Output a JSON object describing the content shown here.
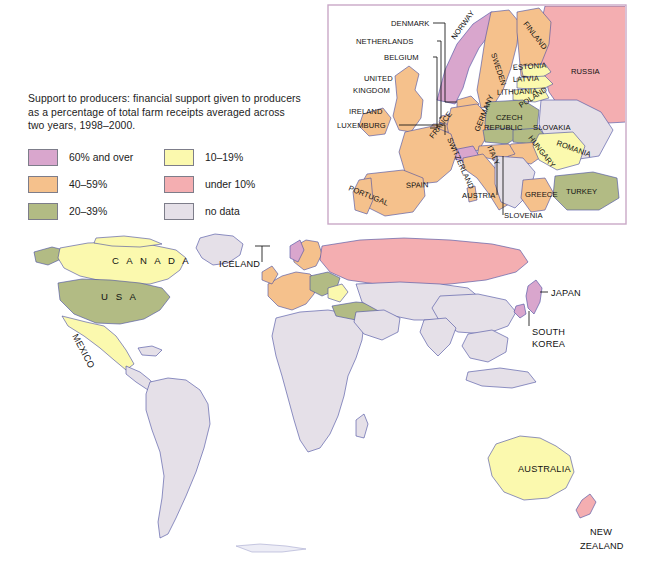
{
  "legend": {
    "caption": "Support to producers: financial support given to producers as a percentage of total farm receipts averaged across two years, 1998–2000.",
    "items": [
      {
        "label": "60% and over",
        "color": "#d9a6cd",
        "name": "legend-swatch-60-and-over"
      },
      {
        "label": "10–19%",
        "color": "#fbf9ae",
        "name": "legend-swatch-10-19"
      },
      {
        "label": "40–59%",
        "color": "#f5c18c",
        "name": "legend-swatch-40-59"
      },
      {
        "label": "under 10%",
        "color": "#f4aeb1",
        "name": "legend-swatch-under-10"
      },
      {
        "label": "20–39%",
        "color": "#b2bb84",
        "name": "legend-swatch-20-39"
      },
      {
        "label": "no data",
        "color": "#e5e0e8",
        "name": "legend-swatch-no-data"
      }
    ]
  },
  "palette": {
    "over60": "#d9a6cd",
    "p40_59": "#f5c18c",
    "p20_39": "#b2bb84",
    "p10_19": "#fbf9ae",
    "under10": "#f4aeb1",
    "nodata": "#e5e0e8",
    "ocean": "#ffffff",
    "coastline": "#4b4fa0",
    "country_border": "#d98f96",
    "inset_frame": "#c9a8c7"
  },
  "world_map": {
    "labels": [
      {
        "text": "C A N A D A",
        "x": 112,
        "y": 264,
        "rotate": 0,
        "style": "spaced",
        "name": "map-label-canada"
      },
      {
        "text": "U S A",
        "x": 101,
        "y": 300,
        "rotate": 0,
        "style": "spaced",
        "name": "map-label-usa"
      },
      {
        "text": "MEXICO",
        "x": 72,
        "y": 336,
        "rotate": 62,
        "style": "plain",
        "name": "map-label-mexico"
      },
      {
        "text": "ICELAND",
        "x": 219,
        "y": 267,
        "rotate": 0,
        "style": "plain",
        "name": "map-label-iceland"
      },
      {
        "text": "JAPAN",
        "x": 551,
        "y": 296,
        "rotate": 0,
        "style": "plain",
        "name": "map-label-japan"
      },
      {
        "text": "SOUTH",
        "x": 532,
        "y": 335,
        "rotate": 0,
        "style": "plain",
        "name": "map-label-south-korea-1"
      },
      {
        "text": "KOREA",
        "x": 532,
        "y": 347,
        "rotate": 0,
        "style": "plain",
        "name": "map-label-south-korea-2"
      },
      {
        "text": "AUSTRALIA",
        "x": 518,
        "y": 472,
        "rotate": 0,
        "style": "plain",
        "name": "map-label-australia"
      },
      {
        "text": "NEW",
        "x": 590,
        "y": 535,
        "rotate": 0,
        "style": "plain",
        "name": "map-label-new-zealand-1"
      },
      {
        "text": "ZEALAND",
        "x": 580,
        "y": 549,
        "rotate": 0,
        "style": "plain",
        "name": "map-label-new-zealand-2"
      }
    ],
    "regions": [
      {
        "name": "canada",
        "value": "10–19%",
        "color": "#fbf9ae"
      },
      {
        "name": "usa",
        "value": "20–39%",
        "color": "#b2bb84"
      },
      {
        "name": "mexico",
        "value": "10–19%",
        "color": "#fbf9ae"
      },
      {
        "name": "iceland",
        "value": "60% and over",
        "color": "#d9a6cd"
      },
      {
        "name": "japan",
        "value": "60% and over",
        "color": "#d9a6cd"
      },
      {
        "name": "south-korea",
        "value": "60% and over",
        "color": "#d9a6cd"
      },
      {
        "name": "australia",
        "value": "10–19%",
        "color": "#fbf9ae"
      },
      {
        "name": "new-zealand",
        "value": "under 10%",
        "color": "#f4aeb1"
      },
      {
        "name": "russia",
        "value": "under 10%",
        "color": "#f4aeb1"
      },
      {
        "name": "south-america",
        "value": "no data",
        "color": "#e5e0e8"
      },
      {
        "name": "africa",
        "value": "no data",
        "color": "#e5e0e8"
      },
      {
        "name": "china-india",
        "value": "no data",
        "color": "#e5e0e8"
      },
      {
        "name": "greenland",
        "value": "no data",
        "color": "#e5e0e8"
      }
    ]
  },
  "inset_map": {
    "labels": [
      {
        "text": "DENMARK",
        "x": 64,
        "y": 22,
        "rotate": 0,
        "name": "inset-label-denmark"
      },
      {
        "text": "NETHERLANDS",
        "x": 29,
        "y": 40,
        "rotate": 0,
        "name": "inset-label-netherlands"
      },
      {
        "text": "BELGIUM",
        "x": 57,
        "y": 56,
        "rotate": 0,
        "name": "inset-label-belgium"
      },
      {
        "text": "UNITED",
        "x": 37,
        "y": 77,
        "rotate": 0,
        "name": "inset-label-united-kingdom-1"
      },
      {
        "text": "KINGDOM",
        "x": 26,
        "y": 89,
        "rotate": 0,
        "name": "inset-label-united-kingdom-2"
      },
      {
        "text": "IRELAND",
        "x": 22,
        "y": 110,
        "rotate": 0,
        "name": "inset-label-ireland"
      },
      {
        "text": "LUXEMBURG",
        "x": 10,
        "y": 124,
        "rotate": 0,
        "name": "inset-label-luxemburg"
      },
      {
        "text": "NORWAY",
        "x": 128,
        "y": 36,
        "rotate": -54,
        "name": "inset-label-norway"
      },
      {
        "text": "SWEDEN",
        "x": 164,
        "y": 50,
        "rotate": 72,
        "name": "inset-label-sweden"
      },
      {
        "text": "FINLAND",
        "x": 196,
        "y": 20,
        "rotate": 52,
        "name": "inset-label-finland"
      },
      {
        "text": "RUSSIA",
        "x": 244,
        "y": 70,
        "rotate": 0,
        "name": "inset-label-russia"
      },
      {
        "text": "ESTONIA",
        "x": 186,
        "y": 66,
        "rotate": -4,
        "name": "inset-label-estonia"
      },
      {
        "text": "LATVIA",
        "x": 186,
        "y": 78,
        "rotate": -3,
        "name": "inset-label-latvia"
      },
      {
        "text": "LITHUANIA",
        "x": 170,
        "y": 91,
        "rotate": -2,
        "name": "inset-label-lithuania"
      },
      {
        "text": "POLAND",
        "x": 194,
        "y": 104,
        "rotate": -33,
        "name": "inset-label-poland"
      },
      {
        "text": "GERMANY",
        "x": 152,
        "y": 128,
        "rotate": -68,
        "name": "inset-label-germany"
      },
      {
        "text": "CZECH",
        "x": 169,
        "y": 116,
        "rotate": 0,
        "name": "inset-label-czech-republic-1"
      },
      {
        "text": "REPUBLIC",
        "x": 157,
        "y": 126,
        "rotate": 0,
        "name": "inset-label-czech-republic-2"
      },
      {
        "text": "SLOVAKIA",
        "x": 206,
        "y": 126,
        "rotate": 0,
        "name": "inset-label-slovakia"
      },
      {
        "text": "HUNGARY",
        "x": 201,
        "y": 134,
        "rotate": 52,
        "name": "inset-label-hungary"
      },
      {
        "text": "ROMANIA",
        "x": 229,
        "y": 141,
        "rotate": 20,
        "name": "inset-label-romania"
      },
      {
        "text": "FRANCE",
        "x": 106,
        "y": 135,
        "rotate": -52,
        "name": "inset-label-france"
      },
      {
        "text": "SWITZERLAND",
        "x": 120,
        "y": 135,
        "rotate": 66,
        "name": "inset-label-switzerland"
      },
      {
        "text": "ITALY",
        "x": 160,
        "y": 143,
        "rotate": 66,
        "name": "inset-label-italy"
      },
      {
        "text": "AUSTRIA",
        "x": 135,
        "y": 194,
        "rotate": 0,
        "name": "inset-label-austria"
      },
      {
        "text": "SLOVENIA",
        "x": 177,
        "y": 214,
        "rotate": 0,
        "name": "inset-label-slovenia"
      },
      {
        "text": "GREECE",
        "x": 198,
        "y": 193,
        "rotate": 0,
        "name": "inset-label-greece"
      },
      {
        "text": "TURKEY",
        "x": 239,
        "y": 190,
        "rotate": 0,
        "name": "inset-label-turkey"
      },
      {
        "text": "SPAIN",
        "x": 79,
        "y": 184,
        "rotate": -2,
        "name": "inset-label-spain"
      },
      {
        "text": "PORTUGAL",
        "x": 21,
        "y": 186,
        "rotate": 22,
        "name": "inset-label-portugal"
      }
    ],
    "regions": [
      {
        "name": "norway",
        "value": "60% and over",
        "color": "#d9a6cd"
      },
      {
        "name": "iceland-inset",
        "value": "60% and over",
        "color": "#d9a6cd"
      },
      {
        "name": "switzerland",
        "value": "60% and over",
        "color": "#d9a6cd"
      },
      {
        "name": "sweden",
        "value": "40–59%",
        "color": "#f5c18c"
      },
      {
        "name": "finland",
        "value": "40–59%",
        "color": "#f5c18c"
      },
      {
        "name": "united-kingdom",
        "value": "40–59%",
        "color": "#f5c18c"
      },
      {
        "name": "ireland",
        "value": "40–59%",
        "color": "#f5c18c"
      },
      {
        "name": "france",
        "value": "40–59%",
        "color": "#f5c18c"
      },
      {
        "name": "germany",
        "value": "40–59%",
        "color": "#f5c18c"
      },
      {
        "name": "spain",
        "value": "40–59%",
        "color": "#f5c18c"
      },
      {
        "name": "italy",
        "value": "40–59%",
        "color": "#f5c18c"
      },
      {
        "name": "greece",
        "value": "40–59%",
        "color": "#f5c18c"
      },
      {
        "name": "poland",
        "value": "20–39%",
        "color": "#b2bb84"
      },
      {
        "name": "czech-republic",
        "value": "20–39%",
        "color": "#b2bb84"
      },
      {
        "name": "slovakia",
        "value": "20–39%",
        "color": "#b2bb84"
      },
      {
        "name": "hungary",
        "value": "20–39%",
        "color": "#b2bb84"
      },
      {
        "name": "turkey",
        "value": "20–39%",
        "color": "#b2bb84"
      },
      {
        "name": "estonia",
        "value": "10–19%",
        "color": "#fbf9ae"
      },
      {
        "name": "latvia",
        "value": "10–19%",
        "color": "#fbf9ae"
      },
      {
        "name": "lithuania",
        "value": "10–19%",
        "color": "#fbf9ae"
      },
      {
        "name": "romania",
        "value": "10–19%",
        "color": "#fbf9ae"
      },
      {
        "name": "russia-inset",
        "value": "under 10%",
        "color": "#f4aeb1"
      }
    ]
  }
}
